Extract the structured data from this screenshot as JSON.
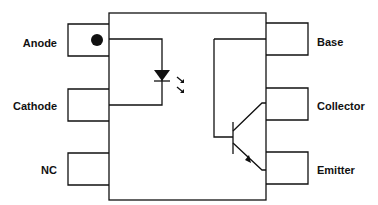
{
  "diagram": {
    "type": "optocoupler-pinout",
    "left_pins": [
      {
        "label": "Anode"
      },
      {
        "label": "Cathode"
      },
      {
        "label": "NC"
      }
    ],
    "right_pins": [
      {
        "label": "Base"
      },
      {
        "label": "Collector"
      },
      {
        "label": "Emitter"
      }
    ],
    "pin1_marker": "dot",
    "internal_components": [
      "LED",
      "NPN phototransistor"
    ],
    "colors": {
      "line": "#111111",
      "background": "#ffffff"
    }
  }
}
